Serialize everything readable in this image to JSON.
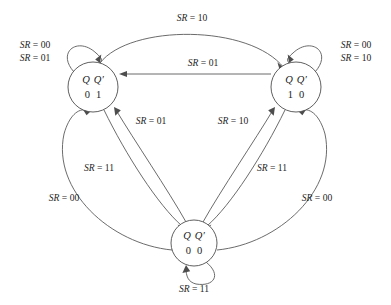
{
  "figure": {
    "kind": "state-transition-diagram",
    "background_color": "#ffffff",
    "line_color": "#5a5a5a",
    "text_color": "#1a1a1a"
  },
  "states": [
    {
      "id": "state-01",
      "name": "Q Q' = 0 1",
      "header_q": "Q",
      "header_qprime": "Q′",
      "value_q": "0",
      "value_qprime": "1",
      "cx": 93,
      "cy": 87,
      "r": 25
    },
    {
      "id": "state-10",
      "name": "Q Q' = 1 0",
      "header_q": "Q",
      "header_qprime": "Q′",
      "value_q": "1",
      "value_qprime": "0",
      "cx": 296,
      "cy": 87,
      "r": 25
    },
    {
      "id": "state-00",
      "name": "Q Q' = 0 0",
      "header_q": "Q",
      "header_qprime": "Q′",
      "value_q": "0",
      "value_qprime": "0",
      "cx": 194,
      "cy": 243,
      "r": 23
    }
  ],
  "transitions": [
    {
      "id": "t-01-self-00",
      "from": "state-01",
      "to": "state-01",
      "label": "SR = 00",
      "label_x": 35,
      "label_y": 46
    },
    {
      "id": "t-01-self-01",
      "from": "state-01",
      "to": "state-01",
      "label": "SR = 01",
      "label_x": 35,
      "label_y": 59
    },
    {
      "id": "t-10-self-00",
      "from": "state-10",
      "to": "state-10",
      "label": "SR = 00",
      "label_x": 356,
      "label_y": 46
    },
    {
      "id": "t-10-self-10",
      "from": "state-10",
      "to": "state-10",
      "label": "SR = 10",
      "label_x": 356,
      "label_y": 59
    },
    {
      "id": "t-01-to-10-top",
      "from": "state-01",
      "to": "state-10",
      "label": "SR = 10",
      "label_x": 192,
      "label_y": 19
    },
    {
      "id": "t-10-to-01-mid",
      "from": "state-10",
      "to": "state-01",
      "label": "SR = 01",
      "label_x": 203,
      "label_y": 64
    },
    {
      "id": "t-00-to-01",
      "from": "state-00",
      "to": "state-01",
      "label": "SR = 01",
      "label_x": 151,
      "label_y": 122
    },
    {
      "id": "t-00-to-10",
      "from": "state-00",
      "to": "state-10",
      "label": "SR = 10",
      "label_x": 233,
      "label_y": 122
    },
    {
      "id": "t-01-to-00-inner",
      "from": "state-01",
      "to": "state-00",
      "label": "SR = 11",
      "label_x": 99,
      "label_y": 169
    },
    {
      "id": "t-10-to-00-inner",
      "from": "state-10",
      "to": "state-00",
      "label": "SR = 11",
      "label_x": 272,
      "label_y": 169
    },
    {
      "id": "t-00-to-01-outer",
      "from": "state-00",
      "to": "state-01",
      "label": "SR = 00",
      "label_x": 64,
      "label_y": 199
    },
    {
      "id": "t-00-to-10-outer",
      "from": "state-00",
      "to": "state-10",
      "label": "SR = 00",
      "label_x": 317,
      "label_y": 199
    },
    {
      "id": "t-00-self-11",
      "from": "state-00",
      "to": "state-00",
      "label": "SR = 11",
      "label_x": 194,
      "label_y": 290
    }
  ],
  "label_parts": {
    "sr_symbol": "SR",
    "equals": " = ",
    "values": [
      "00",
      "01",
      "10",
      "11"
    ]
  }
}
